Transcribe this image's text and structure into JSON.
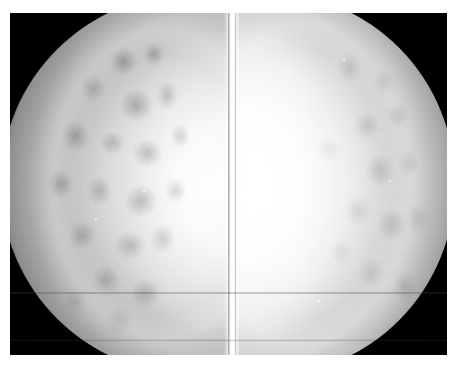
{
  "image": {
    "kind": "medical-radiograph",
    "modality": "Mammography",
    "view_description": "Bilateral mammogram — two breast views mounted back-to-back",
    "alt_text": "Grayscale bilateral mammogram showing two breasts in mirrored orientation with dense heterogeneous fibroglandular tissue on a black background",
    "width_px": 462,
    "height_px": 366
  },
  "film": {
    "left_px": 10,
    "top_px": 13,
    "width_px": 437,
    "height_px": 342,
    "background_color": "#000000",
    "border_color": "#ffffff"
  },
  "panels": [
    {
      "id": "left-view",
      "label": "Left breast view",
      "side": "left",
      "chest_wall_side": "right",
      "skin_line_side": "left",
      "tissue_density": "heterogeneously dense",
      "brightness": "moderate, mottled",
      "x_px": 0,
      "width_px": 218
    },
    {
      "id": "right-view",
      "label": "Right breast view",
      "side": "right",
      "chest_wall_side": "left",
      "skin_line_side": "right",
      "tissue_density": "extremely dense",
      "brightness": "bright, homogeneous core",
      "x_px": 226,
      "width_px": 211
    }
  ],
  "seam": {
    "label": "Bright vertical film seam",
    "x_px": 214,
    "width_px": 16,
    "color": "#ffffff"
  },
  "palette": {
    "background": "#000000",
    "page": "#ffffff",
    "tissue_bright": "#ffffff",
    "tissue_mid": "#c8c8c8",
    "tissue_dark": "#6e6e6e",
    "film_black": "#000000"
  },
  "specks": [
    {
      "name": "microcalcification-speck",
      "x_px": 389,
      "y_px": 180
    },
    {
      "name": "microcalcification-speck",
      "x_px": 318,
      "y_px": 300
    },
    {
      "name": "microcalcification-speck",
      "x_px": 143,
      "y_px": 190
    },
    {
      "name": "microcalcification-speck",
      "x_px": 95,
      "y_px": 218
    },
    {
      "name": "microcalcification-speck",
      "x_px": 343,
      "y_px": 59
    }
  ],
  "annotations": {
    "markers": [],
    "text_overlays": [],
    "note": "No text, labels, markers or UI chrome are rendered in this image."
  }
}
